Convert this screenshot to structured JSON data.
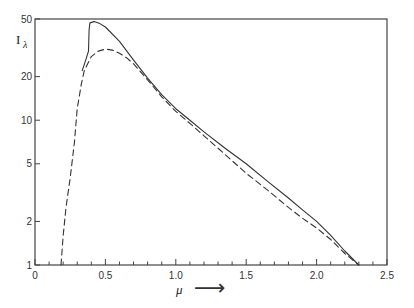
{
  "chart_data": {
    "type": "line",
    "title": "",
    "xlabel": "μ",
    "xlabel_arrow": "⟶",
    "ylabel": "I",
    "ylabel_subscript": "λ",
    "xlim": [
      0,
      2.5
    ],
    "ylim": [
      1,
      50
    ],
    "yscale": "log",
    "grid": false,
    "legend": null,
    "x_ticks": [
      {
        "value": 0,
        "label": "0"
      },
      {
        "value": 0.5,
        "label": "0.5"
      },
      {
        "value": 1.0,
        "label": "1.0"
      },
      {
        "value": 1.5,
        "label": "1.5"
      },
      {
        "value": 2.0,
        "label": "2.0"
      },
      {
        "value": 2.5,
        "label": "2.5"
      }
    ],
    "x_minor_step": 0.1,
    "y_ticks": [
      {
        "value": 1,
        "label": "1"
      },
      {
        "value": 2,
        "label": "2"
      },
      {
        "value": 5,
        "label": "5"
      },
      {
        "value": 10,
        "label": "10"
      },
      {
        "value": 20,
        "label": "20"
      },
      {
        "value": 50,
        "label": "50"
      }
    ],
    "series": [
      {
        "name": "solid",
        "style": "solid",
        "x": [
          0.335,
          0.36,
          0.38,
          0.384,
          0.39,
          0.42,
          0.46,
          0.5,
          0.6,
          0.7,
          0.8,
          0.9,
          1.0,
          1.1,
          1.2,
          1.35,
          1.5,
          1.65,
          1.8,
          1.9,
          2.0,
          2.1,
          2.2,
          2.3
        ],
        "y": [
          22,
          26,
          30,
          42,
          47,
          48,
          46.5,
          44,
          35,
          26,
          19.5,
          15,
          12,
          10,
          8.3,
          6.4,
          5.0,
          3.8,
          2.9,
          2.4,
          2.0,
          1.6,
          1.25,
          1.0
        ]
      },
      {
        "name": "dashed",
        "style": "dashed",
        "x": [
          0.185,
          0.2,
          0.22,
          0.25,
          0.28,
          0.3,
          0.33,
          0.35,
          0.4,
          0.45,
          0.5,
          0.55,
          0.6,
          0.65,
          0.7,
          0.8,
          0.9,
          1.0,
          1.1,
          1.2,
          1.35,
          1.5,
          1.65,
          1.8,
          1.9,
          2.0,
          2.1,
          2.2,
          2.3
        ],
        "y": [
          1.0,
          1.6,
          2.5,
          4.0,
          7.0,
          12,
          18,
          22,
          27.5,
          30,
          31,
          30.5,
          29,
          27,
          24.5,
          19,
          14.5,
          11.5,
          9.5,
          7.8,
          5.8,
          4.3,
          3.3,
          2.5,
          2.1,
          1.8,
          1.5,
          1.2,
          1.0
        ]
      }
    ],
    "frame_color": "#444444",
    "line_color": "#333333"
  }
}
